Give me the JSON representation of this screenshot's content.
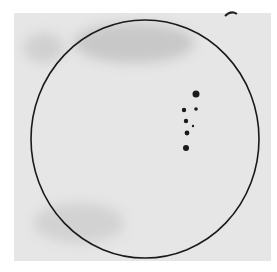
{
  "image": {
    "description": "Scanned drawing of the solar disk with a sunspot group",
    "colors": {
      "paper": "#e6e6e6",
      "ink": "#1a1a1a",
      "background": "#ffffff"
    },
    "disk": {
      "cx": 145,
      "cy": 139,
      "rx": 114,
      "ry": 119
    },
    "spots": [
      {
        "x": 196,
        "y": 94,
        "r": 3.5
      },
      {
        "x": 184,
        "y": 110,
        "r": 2.2
      },
      {
        "x": 196,
        "y": 109,
        "r": 1.8
      },
      {
        "x": 186,
        "y": 121,
        "r": 2.2
      },
      {
        "x": 193,
        "y": 126,
        "r": 1.2
      },
      {
        "x": 187,
        "y": 133,
        "r": 2.4
      },
      {
        "x": 186,
        "y": 148,
        "r": 3
      }
    ]
  }
}
